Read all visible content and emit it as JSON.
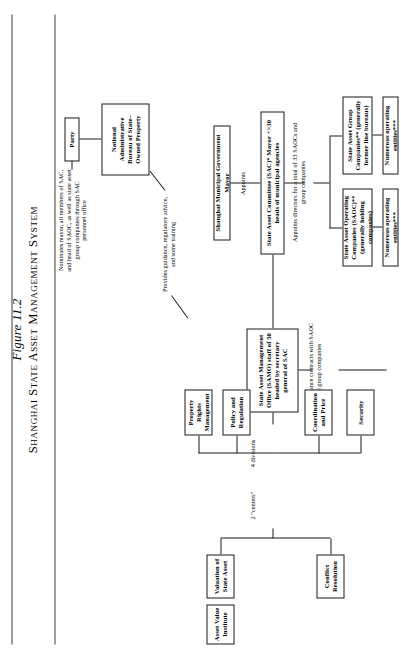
{
  "figure": {
    "number": "Figure 11.2",
    "title": "Shanghai State Asset Management System"
  },
  "boxes": {
    "party": "Party",
    "national_bureau": "National Administrative Bureau of State–Owned Property",
    "mayor": "Shanghai Municipal Government Mayor",
    "sac": "State Asset Committee (SAC)* Mayor +>30 heads of municipal agencies",
    "samo": "State Asset Management Office (SAMO) staff of 50 headed by secretary general of SAC",
    "saoc": "State Asset Operating Companies (SAOC)** (generally holding companies)",
    "sagc": "State Asset Group Companies** (generally former line bureaus)",
    "operating_left": "Numerous operating entities***",
    "operating_right": "Numerous operating entities***",
    "security": "Security",
    "coordination_price": "Coordination and Price",
    "policy_regulation": "Policy and Regulation",
    "property_rights": "Property Rights Management",
    "conflict_resolution": "Conflict Resolution",
    "valuation": "Valuation of State Asset",
    "asset_value_institute": "Asset Value Institute"
  },
  "notes": {
    "nominates": "Nominates mayor, all members of SAC, and head of SAOC, as well as state asset group companies through SAC personnel office",
    "provides_guidance": "Provides guidance, regulatory advice, and some training",
    "appoints": "Appoints",
    "appoints_directors": "Appoints directors for a total of 33 SAOCs and group companies",
    "performance_contracts": "12 performance contracts with SAOC and group companies",
    "four_divisions": "4 divisions",
    "two_centers": "2 \"centers\""
  }
}
